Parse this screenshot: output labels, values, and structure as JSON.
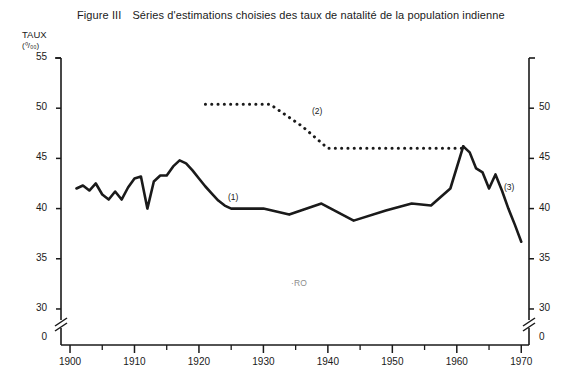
{
  "figure": {
    "number_label": "Figure III",
    "title": "Séries d'estimations choisies des taux de natalité de la population indienne",
    "axis_unit_line1": "TAUX",
    "axis_unit_line2": "(⁰/₀₀)",
    "annotation_ro": "·RO",
    "series_tag_1": "(1)",
    "series_tag_2": "(2)",
    "series_tag_3": "(3)",
    "ink_color": "#1a1a1a"
  },
  "chart_data": {
    "type": "line",
    "title": "Séries d'estimations choisies des taux de natalité de la population indienne",
    "xlabel": "",
    "ylabel": "TAUX (⁰/₀₀)",
    "xlim": [
      1898,
      1971
    ],
    "ylim": [
      28.5,
      55
    ],
    "ylim_display_with_break": [
      0,
      55
    ],
    "axis_break": true,
    "axis_break_between": [
      0,
      30
    ],
    "grid": false,
    "legend_position": "inline-annotations",
    "x_ticks_major": [
      1900,
      1910,
      1920,
      1930,
      1940,
      1950,
      1960,
      1970
    ],
    "x_tick_labels": [
      "1900",
      "1910",
      "1920",
      "1930",
      "1940",
      "1950",
      "1960",
      "1970"
    ],
    "x_ticks_minor": [
      1905,
      1915,
      1925,
      1935,
      1945,
      1955,
      1965
    ],
    "y_ticks_left": [
      55,
      50,
      45,
      40,
      35,
      30,
      0
    ],
    "y_tick_labels_left": [
      "55",
      "50",
      "45",
      "40",
      "35",
      "30",
      "0"
    ],
    "y_ticks_right": [
      50,
      45,
      40,
      35,
      30,
      0
    ],
    "y_tick_labels_right": [
      "50",
      "45",
      "40",
      "35",
      "30",
      "0"
    ],
    "series": [
      {
        "name": "(1)",
        "style": "solid",
        "label_x": 1926,
        "label_y": 40.9,
        "x": [
          1901,
          1902,
          1903,
          1904,
          1905,
          1906,
          1907,
          1908,
          1909,
          1910,
          1911,
          1912,
          1913,
          1914,
          1915,
          1916,
          1917,
          1918,
          1919,
          1920,
          1921,
          1922,
          1923,
          1924,
          1925,
          1930,
          1934,
          1939,
          1944,
          1949,
          1953,
          1956,
          1959,
          1961
        ],
        "y": [
          42.0,
          42.3,
          41.8,
          42.5,
          41.4,
          40.9,
          41.7,
          40.9,
          42.1,
          43.0,
          43.2,
          40.0,
          42.7,
          43.3,
          43.3,
          44.2,
          44.8,
          44.5,
          43.8,
          43.0,
          42.2,
          41.5,
          40.8,
          40.3,
          40.0,
          40.0,
          39.4,
          40.5,
          38.8,
          39.8,
          40.5,
          40.3,
          42.0,
          46.2
        ]
      },
      {
        "name": "(2)",
        "style": "dotted",
        "label_x": 1933,
        "label_y": 48.6,
        "x": [
          1921,
          1926,
          1931,
          1936,
          1940,
          1945,
          1950,
          1955,
          1960,
          1961
        ],
        "y": [
          50.4,
          50.4,
          50.4,
          48.2,
          46.0,
          46.0,
          46.0,
          46.0,
          46.0,
          46.0
        ]
      },
      {
        "name": "(3)",
        "style": "solid",
        "label_x": 1967,
        "label_y": 41.6,
        "x": [
          1961,
          1962,
          1963,
          1964,
          1965,
          1966,
          1967,
          1968,
          1969,
          1970
        ],
        "y": [
          46.2,
          45.6,
          44.0,
          43.6,
          42.0,
          43.4,
          41.8,
          40.0,
          38.4,
          36.7
        ]
      }
    ]
  }
}
